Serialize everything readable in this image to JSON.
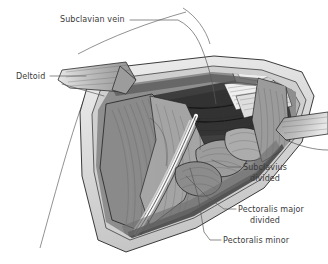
{
  "figure": {
    "name": "infraclavicular-dissection",
    "style": "grayscale-line-and-tone medical illustration"
  },
  "labels": [
    {
      "id": "subclavian-vein",
      "text": "Subclavian vein",
      "x": 60,
      "y": 22,
      "anchor": "start"
    },
    {
      "id": "deltoid",
      "text": "Deltoid",
      "x": 16,
      "y": 79,
      "anchor": "start"
    },
    {
      "id": "subclavius-divided-1",
      "text": "Subclavius",
      "x": 243,
      "y": 170,
      "anchor": "start"
    },
    {
      "id": "subclavius-divided-2",
      "text": "divided",
      "x": 250,
      "y": 181,
      "anchor": "start"
    },
    {
      "id": "pec-major-divided-1",
      "text": "Pectoralis major",
      "x": 238,
      "y": 212,
      "anchor": "start"
    },
    {
      "id": "pec-major-divided-2",
      "text": "divided",
      "x": 250,
      "y": 223,
      "anchor": "start"
    },
    {
      "id": "pectoralis-minor",
      "text": "Pectoralis minor",
      "x": 223,
      "y": 243,
      "anchor": "start"
    }
  ],
  "colors": {
    "background": "#ffffff",
    "text": "#3b3b3b",
    "leader": "#5a5a5a",
    "outline": "#262626",
    "skin_light": "#e3e3e3",
    "skin_mid": "#c9c9c9",
    "fascia": "#b0b0b0",
    "muscle_light": "#a8a8a8",
    "muscle_mid": "#8d8d8d",
    "muscle_dark": "#6a6a6a",
    "shadow": "#3c3c3c",
    "deep_shadow": "#2a2a2a",
    "highlight": "#f4f4f4",
    "vessel_pale": "#dcdcdc"
  }
}
